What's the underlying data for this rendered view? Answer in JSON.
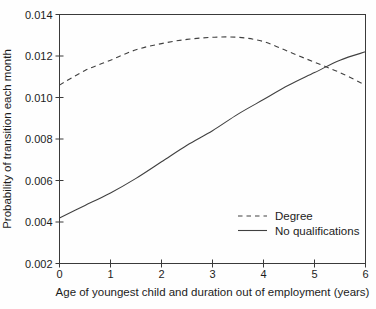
{
  "figure": {
    "background": "#fefefe",
    "frame_color": "#3a3a3a",
    "line_color": "#404040",
    "text_color": "#1c1c1c"
  },
  "chart_data": {
    "type": "line",
    "title": "",
    "xlabel": "Age of youngest child and duration out of employment (years)",
    "ylabel": "Probability of transition each month",
    "xlim": [
      0,
      6
    ],
    "ylim": [
      0.002,
      0.014
    ],
    "x_ticks": [
      0,
      1,
      2,
      3,
      4,
      5,
      6
    ],
    "x_tick_labels": [
      "0",
      "1",
      "2",
      "3",
      "4",
      "5",
      "6"
    ],
    "y_ticks": [
      0.002,
      0.004,
      0.006,
      0.008,
      0.01,
      0.012,
      0.014
    ],
    "y_tick_labels": [
      "0.002",
      "0.004",
      "0.006",
      "0.008",
      "0.010",
      "0.012",
      "0.014"
    ],
    "grid": false,
    "legend_position": "inside-lower-right",
    "x": [
      0,
      0.5,
      1,
      1.5,
      2,
      2.5,
      3,
      3.5,
      4,
      4.5,
      5,
      5.5,
      6
    ],
    "series": [
      {
        "name": "Degree",
        "style": "dashed",
        "values": [
          0.0106,
          0.0113,
          0.0118,
          0.0123,
          0.0126,
          0.0128,
          0.0129,
          0.0129,
          0.0127,
          0.0122,
          0.0117,
          0.0112,
          0.0106
        ]
      },
      {
        "name": "No qualifications",
        "style": "solid",
        "values": [
          0.0042,
          0.0048,
          0.0054,
          0.0061,
          0.0069,
          0.0077,
          0.0084,
          0.0092,
          0.0099,
          0.0106,
          0.0112,
          0.0118,
          0.0122
        ]
      }
    ]
  }
}
